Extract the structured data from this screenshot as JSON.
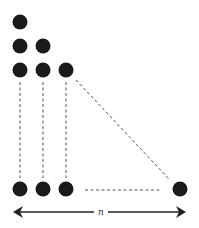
{
  "diagram": {
    "columns": [
      {
        "index": 1,
        "dot_count": 3
      },
      {
        "index": 2,
        "dot_count": 2
      },
      {
        "index": 3,
        "dot_count": 1
      }
    ],
    "final_column": {
      "dot_count": 1
    },
    "base_arrow": {
      "label": "n",
      "style": "double-headed"
    },
    "connectors": [
      "vertical-dashed",
      "diagonal-dashed",
      "horizontal-dashed"
    ],
    "colors": {
      "dot": "#1a1a1a",
      "dash": "#555555",
      "arrow": "#222222"
    }
  }
}
